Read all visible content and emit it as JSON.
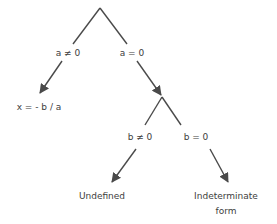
{
  "diagram": {
    "type": "decision-tree",
    "line_color": "#4a4a4a",
    "text_color": "#404040",
    "edges": {
      "a_not_zero": "a ≠ 0",
      "a_zero": "a = 0",
      "b_not_zero": "b ≠ 0",
      "b_zero": "b = 0"
    },
    "outcomes": {
      "solution": "x = - b / a",
      "undefined": "Undefined",
      "indeterminate_line1": "Indeterminate",
      "indeterminate_line2": "form"
    }
  }
}
